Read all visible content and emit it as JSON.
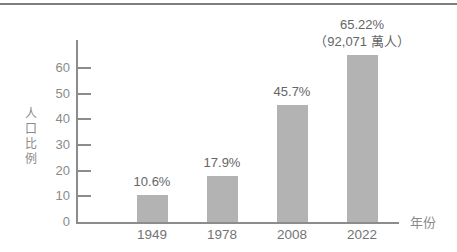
{
  "figure": {
    "background": "#ffffff",
    "divider_color": "#7e7e7e"
  },
  "chart_data": {
    "type": "bar",
    "title": "",
    "categories": [
      "1949",
      "1978",
      "2008",
      "2022"
    ],
    "values": [
      10.6,
      17.9,
      45.7,
      65.22
    ],
    "bar_labels": [
      "10.6%",
      "17.9%",
      "45.7%",
      "65.22%"
    ],
    "bar_sublabels": [
      "",
      "",
      "",
      "（92,071 萬人）"
    ],
    "xlabel": "年份",
    "ylabel": "人口比例",
    "y_ticks": [
      0,
      10,
      20,
      30,
      40,
      50,
      60
    ],
    "ylim": [
      0,
      71
    ],
    "grid": false,
    "legend": false,
    "bar_color": "#b3b3b3",
    "axis_color": "#8c8c8c",
    "label_color": "#666666",
    "tick_label_color": "#8a8a8a",
    "category_label_color": "#737373"
  }
}
